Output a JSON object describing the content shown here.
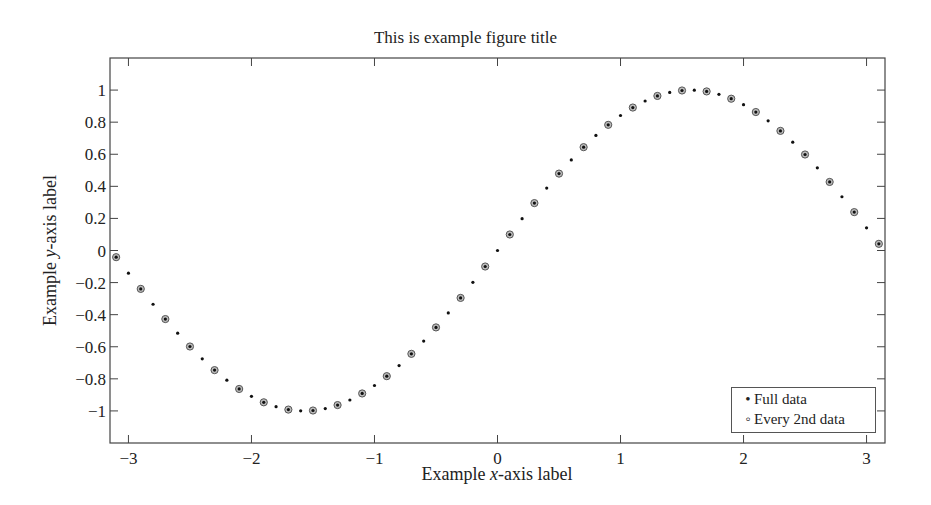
{
  "chart_data": {
    "type": "scatter",
    "title": "This is example figure title",
    "xlabel": "Example x-axis label",
    "ylabel": "Example y-axis label",
    "xlim": [
      -3.15,
      3.15
    ],
    "ylim": [
      -1.2,
      1.2
    ],
    "xticks": [
      -3,
      -2,
      -1,
      0,
      1,
      2,
      3
    ],
    "xtick_labels": [
      "−3",
      "−2",
      "−1",
      "0",
      "1",
      "2",
      "3"
    ],
    "yticks": [
      1,
      0.8,
      0.6,
      0.4,
      0.2,
      0,
      -0.2,
      -0.4,
      -0.6,
      -0.8,
      -1
    ],
    "ytick_labels": [
      "1",
      "0.8",
      "0.6",
      "0.4",
      "0.2",
      "0",
      "−0.2",
      "−0.4",
      "−0.6",
      "−0.8",
      "−1"
    ],
    "grid": false,
    "legend_position": "lower right",
    "series": [
      {
        "name": "Full data",
        "marker": "dot",
        "function": "sin(x)",
        "x_start": -3.1,
        "x_end": 3.1,
        "x_step": 0.1
      },
      {
        "name": "Every 2nd data",
        "marker": "circle",
        "function": "sin(x)",
        "x_start": -3.1,
        "x_end": 3.1,
        "x_step": 0.2
      }
    ]
  },
  "legend": {
    "items": [
      {
        "marker": "•",
        "label": "Full data"
      },
      {
        "marker": "◦",
        "label": "Every 2nd data"
      }
    ]
  }
}
